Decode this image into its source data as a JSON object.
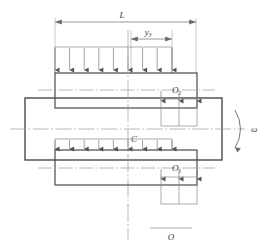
{
  "diagram": {
    "labels": {
      "length": "L",
      "offset": "y",
      "offset_sub": "3",
      "bearing_top": "O",
      "bearing_top_sub": "2",
      "bearing_bottom": "O",
      "bearing_bottom_sub": "1",
      "center": "C",
      "origin": "O",
      "angular_velocity": "ω"
    },
    "colors": {
      "outline": "#4a4a4a",
      "body_outline": "#5a5a5a",
      "arrow": "#7a7a7a",
      "centerline": "#9a9a9a",
      "dimension": "#8a8a8a",
      "text": "#3a3a3a",
      "background": "#ffffff"
    },
    "geometry": {
      "load_arrow_count_top": 9,
      "load_arrow_count_bottom": 9,
      "bearing_arrow_count": 3,
      "dimension_L_start_x": 55,
      "dimension_L_end_x": 196,
      "dimension_y3_start_x": 131,
      "dimension_y3_end_x": 172,
      "main_body": {
        "x": 25,
        "y": 98,
        "w": 197,
        "h": 62
      },
      "top_plate": {
        "x": 55,
        "y": 73,
        "w": 142,
        "h": 35
      },
      "bottom_plate": {
        "x": 55,
        "y": 150,
        "w": 142,
        "h": 35
      }
    }
  }
}
